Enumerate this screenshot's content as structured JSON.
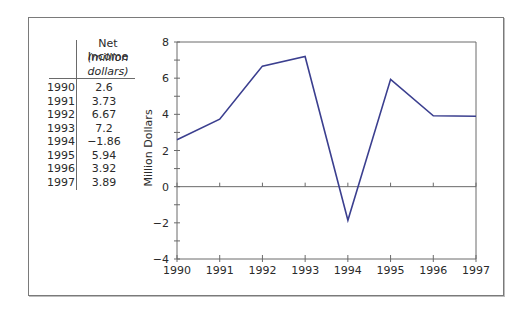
{
  "table": {
    "header": [
      "Net Income",
      "(million",
      "dollars)"
    ],
    "rows": [
      {
        "year": "1990",
        "value": "2.6"
      },
      {
        "year": "1991",
        "value": "3.73"
      },
      {
        "year": "1992",
        "value": "6.67"
      },
      {
        "year": "1993",
        "value": "7.2"
      },
      {
        "year": "1994",
        "value": "−1.86"
      },
      {
        "year": "1995",
        "value": "5.94"
      },
      {
        "year": "1996",
        "value": "3.92"
      },
      {
        "year": "1997",
        "value": "3.89"
      }
    ]
  },
  "chart_data": {
    "type": "line",
    "title": "",
    "xlabel": "",
    "ylabel": "Million Dollars",
    "x": [
      1990,
      1991,
      1992,
      1993,
      1994,
      1995,
      1996,
      1997
    ],
    "categories": [
      "1990",
      "1991",
      "1992",
      "1993",
      "1994",
      "1995",
      "1996",
      "1997"
    ],
    "series": [
      {
        "name": "Net Income",
        "values": [
          2.6,
          3.73,
          6.67,
          7.2,
          -1.86,
          5.94,
          3.92,
          3.89
        ],
        "color": "#3b3f8f"
      }
    ],
    "ylim": [
      -4,
      8
    ],
    "yticks": [
      "8",
      "6",
      "4",
      "2",
      "0",
      "−2",
      "−4"
    ],
    "ytick_values": [
      8,
      6,
      4,
      2,
      0,
      -2,
      -4
    ],
    "xlim": [
      1990,
      1997
    ],
    "grid": false,
    "zero_line": true,
    "legend": null
  }
}
